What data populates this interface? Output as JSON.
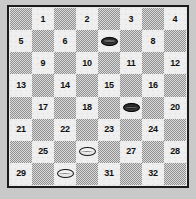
{
  "board": {
    "title": "Draughts board",
    "rows": 8,
    "columns": 8,
    "numbering_scheme": "1-32 playable squares",
    "colors": {
      "light_square": "#efefef",
      "dark_square": "#cfcfcf",
      "border": "#1b1b1b",
      "page_background": "#c9c9c9",
      "dark_piece": "#1f1f1f",
      "light_piece": "#f3f3f3",
      "number_text": "#101010"
    },
    "squares": [
      {
        "row": 1,
        "col": 1,
        "shade": "dark",
        "number": "",
        "piece": ""
      },
      {
        "row": 1,
        "col": 2,
        "shade": "light",
        "number": "1",
        "piece": ""
      },
      {
        "row": 1,
        "col": 3,
        "shade": "dark",
        "number": "",
        "piece": ""
      },
      {
        "row": 1,
        "col": 4,
        "shade": "light",
        "number": "2",
        "piece": ""
      },
      {
        "row": 1,
        "col": 5,
        "shade": "dark",
        "number": "",
        "piece": ""
      },
      {
        "row": 1,
        "col": 6,
        "shade": "light",
        "number": "3",
        "piece": ""
      },
      {
        "row": 1,
        "col": 7,
        "shade": "dark",
        "number": "",
        "piece": ""
      },
      {
        "row": 1,
        "col": 8,
        "shade": "light",
        "number": "4",
        "piece": ""
      },
      {
        "row": 2,
        "col": 1,
        "shade": "light",
        "number": "5",
        "piece": ""
      },
      {
        "row": 2,
        "col": 2,
        "shade": "dark",
        "number": "",
        "piece": ""
      },
      {
        "row": 2,
        "col": 3,
        "shade": "light",
        "number": "6",
        "piece": ""
      },
      {
        "row": 2,
        "col": 4,
        "shade": "dark",
        "number": "",
        "piece": ""
      },
      {
        "row": 2,
        "col": 5,
        "shade": "light",
        "number": "",
        "piece": "dark"
      },
      {
        "row": 2,
        "col": 6,
        "shade": "dark",
        "number": "",
        "piece": ""
      },
      {
        "row": 2,
        "col": 7,
        "shade": "light",
        "number": "8",
        "piece": ""
      },
      {
        "row": 2,
        "col": 8,
        "shade": "dark",
        "number": "",
        "piece": ""
      },
      {
        "row": 3,
        "col": 1,
        "shade": "dark",
        "number": "",
        "piece": ""
      },
      {
        "row": 3,
        "col": 2,
        "shade": "light",
        "number": "9",
        "piece": ""
      },
      {
        "row": 3,
        "col": 3,
        "shade": "dark",
        "number": "",
        "piece": ""
      },
      {
        "row": 3,
        "col": 4,
        "shade": "light",
        "number": "10",
        "piece": ""
      },
      {
        "row": 3,
        "col": 5,
        "shade": "dark",
        "number": "",
        "piece": ""
      },
      {
        "row": 3,
        "col": 6,
        "shade": "light",
        "number": "11",
        "piece": ""
      },
      {
        "row": 3,
        "col": 7,
        "shade": "dark",
        "number": "",
        "piece": ""
      },
      {
        "row": 3,
        "col": 8,
        "shade": "light",
        "number": "12",
        "piece": ""
      },
      {
        "row": 4,
        "col": 1,
        "shade": "light",
        "number": "13",
        "piece": ""
      },
      {
        "row": 4,
        "col": 2,
        "shade": "dark",
        "number": "",
        "piece": ""
      },
      {
        "row": 4,
        "col": 3,
        "shade": "light",
        "number": "14",
        "piece": ""
      },
      {
        "row": 4,
        "col": 4,
        "shade": "dark",
        "number": "",
        "piece": ""
      },
      {
        "row": 4,
        "col": 5,
        "shade": "light",
        "number": "15",
        "piece": ""
      },
      {
        "row": 4,
        "col": 6,
        "shade": "dark",
        "number": "",
        "piece": ""
      },
      {
        "row": 4,
        "col": 7,
        "shade": "light",
        "number": "16",
        "piece": ""
      },
      {
        "row": 4,
        "col": 8,
        "shade": "dark",
        "number": "",
        "piece": ""
      },
      {
        "row": 5,
        "col": 1,
        "shade": "dark",
        "number": "",
        "piece": ""
      },
      {
        "row": 5,
        "col": 2,
        "shade": "light",
        "number": "17",
        "piece": ""
      },
      {
        "row": 5,
        "col": 3,
        "shade": "dark",
        "number": "",
        "piece": ""
      },
      {
        "row": 5,
        "col": 4,
        "shade": "light",
        "number": "18",
        "piece": ""
      },
      {
        "row": 5,
        "col": 5,
        "shade": "dark",
        "number": "",
        "piece": ""
      },
      {
        "row": 5,
        "col": 6,
        "shade": "light",
        "number": "",
        "piece": "dark"
      },
      {
        "row": 5,
        "col": 7,
        "shade": "dark",
        "number": "",
        "piece": ""
      },
      {
        "row": 5,
        "col": 8,
        "shade": "light",
        "number": "20",
        "piece": ""
      },
      {
        "row": 6,
        "col": 1,
        "shade": "light",
        "number": "21",
        "piece": ""
      },
      {
        "row": 6,
        "col": 2,
        "shade": "dark",
        "number": "",
        "piece": ""
      },
      {
        "row": 6,
        "col": 3,
        "shade": "light",
        "number": "22",
        "piece": ""
      },
      {
        "row": 6,
        "col": 4,
        "shade": "dark",
        "number": "",
        "piece": ""
      },
      {
        "row": 6,
        "col": 5,
        "shade": "light",
        "number": "23",
        "piece": ""
      },
      {
        "row": 6,
        "col": 6,
        "shade": "dark",
        "number": "",
        "piece": ""
      },
      {
        "row": 6,
        "col": 7,
        "shade": "light",
        "number": "24",
        "piece": ""
      },
      {
        "row": 6,
        "col": 8,
        "shade": "dark",
        "number": "",
        "piece": ""
      },
      {
        "row": 7,
        "col": 1,
        "shade": "dark",
        "number": "",
        "piece": ""
      },
      {
        "row": 7,
        "col": 2,
        "shade": "light",
        "number": "25",
        "piece": ""
      },
      {
        "row": 7,
        "col": 3,
        "shade": "dark",
        "number": "",
        "piece": ""
      },
      {
        "row": 7,
        "col": 4,
        "shade": "light",
        "number": "",
        "piece": "light"
      },
      {
        "row": 7,
        "col": 5,
        "shade": "dark",
        "number": "",
        "piece": ""
      },
      {
        "row": 7,
        "col": 6,
        "shade": "light",
        "number": "27",
        "piece": ""
      },
      {
        "row": 7,
        "col": 7,
        "shade": "dark",
        "number": "",
        "piece": ""
      },
      {
        "row": 7,
        "col": 8,
        "shade": "light",
        "number": "28",
        "piece": ""
      },
      {
        "row": 8,
        "col": 1,
        "shade": "light",
        "number": "29",
        "piece": ""
      },
      {
        "row": 8,
        "col": 2,
        "shade": "dark",
        "number": "",
        "piece": ""
      },
      {
        "row": 8,
        "col": 3,
        "shade": "light",
        "number": "",
        "piece": "light"
      },
      {
        "row": 8,
        "col": 4,
        "shade": "dark",
        "number": "",
        "piece": ""
      },
      {
        "row": 8,
        "col": 5,
        "shade": "light",
        "number": "31",
        "piece": ""
      },
      {
        "row": 8,
        "col": 6,
        "shade": "dark",
        "number": "",
        "piece": ""
      },
      {
        "row": 8,
        "col": 7,
        "shade": "light",
        "number": "32",
        "piece": ""
      },
      {
        "row": 8,
        "col": 8,
        "shade": "dark",
        "number": "",
        "piece": ""
      }
    ],
    "pieces": [
      {
        "color": "dark",
        "square": "7",
        "icon": "dark-checker-icon"
      },
      {
        "color": "dark",
        "square": "19",
        "icon": "dark-checker-icon"
      },
      {
        "color": "light",
        "square": "26",
        "icon": "light-checker-icon"
      },
      {
        "color": "light",
        "square": "30",
        "icon": "light-checker-icon"
      }
    ]
  }
}
